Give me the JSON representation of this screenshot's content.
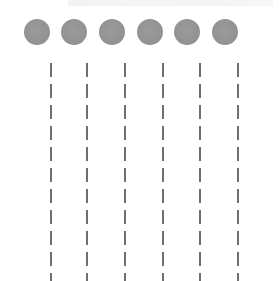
{
  "diagram": {
    "dot_count": 6,
    "line_count": 6,
    "colors": {
      "dot": "#939393",
      "dash": "#6f6f6f",
      "background": "#ffffff"
    },
    "dots": [
      {
        "index": 1,
        "cx": 37
      },
      {
        "index": 2,
        "cx": 74
      },
      {
        "index": 3,
        "cx": 112
      },
      {
        "index": 4,
        "cx": 150
      },
      {
        "index": 5,
        "cx": 187
      },
      {
        "index": 6,
        "cx": 225
      }
    ],
    "lines": [
      {
        "index": 1,
        "x": 51
      },
      {
        "index": 2,
        "x": 87
      },
      {
        "index": 3,
        "x": 125
      },
      {
        "index": 4,
        "x": 163
      },
      {
        "index": 5,
        "x": 200
      },
      {
        "index": 6,
        "x": 238
      }
    ],
    "dash_pattern": {
      "dash_px": 14,
      "gap_px": 7
    }
  }
}
